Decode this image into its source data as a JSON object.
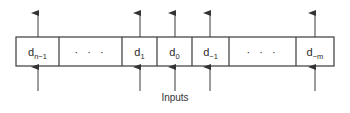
{
  "diagram": {
    "type": "register",
    "caption": "Inputs",
    "box": {
      "left": 16,
      "top": 37,
      "right": 334,
      "bottom": 66
    },
    "cells": [
      {
        "id": "d_n_minus_1",
        "base": "d",
        "sub": "n−1",
        "x0": 16,
        "x1": 59,
        "arrows": true
      },
      {
        "id": "ellipsis_left",
        "text": "· · ·",
        "x0": 59,
        "x1": 122,
        "arrows": false
      },
      {
        "id": "d_1",
        "base": "d",
        "sub": "1",
        "x0": 122,
        "x1": 157,
        "arrows": true
      },
      {
        "id": "d_0",
        "base": "d",
        "sub": "0",
        "x0": 157,
        "x1": 192,
        "arrows": true
      },
      {
        "id": "d_minus_1",
        "base": "d",
        "sub": "−1",
        "x0": 192,
        "x1": 229,
        "arrows": true
      },
      {
        "id": "ellipsis_right",
        "text": "· · ·",
        "x0": 229,
        "x1": 296,
        "arrows": false
      },
      {
        "id": "d_minus_m",
        "base": "d",
        "sub": "−m",
        "x0": 296,
        "x1": 334,
        "arrows": true
      }
    ],
    "colors": {
      "line": "#3a3a3a",
      "text": "#2a2a2a",
      "background": "#ffffff"
    }
  }
}
